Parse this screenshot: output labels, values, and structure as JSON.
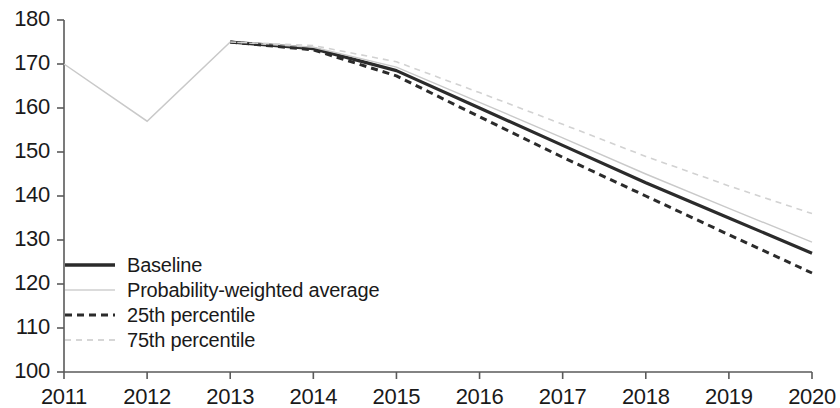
{
  "chart_data": {
    "type": "line",
    "title": "",
    "xlabel": "",
    "ylabel": "",
    "x": [
      2011,
      2012,
      2013,
      2014,
      2015,
      2016,
      2017,
      2018,
      2019,
      2020
    ],
    "categories": [
      "2011",
      "2012",
      "2013",
      "2014",
      "2015",
      "2016",
      "2017",
      "2018",
      "2019",
      "2020"
    ],
    "xlim": [
      2011,
      2020
    ],
    "ylim": [
      100,
      180
    ],
    "y_ticks": [
      100,
      110,
      120,
      130,
      140,
      150,
      160,
      170,
      180
    ],
    "x_ticks": [
      "2011",
      "2012",
      "2013",
      "2014",
      "2015",
      "2016",
      "2017",
      "2018",
      "2019",
      "2020"
    ],
    "grid": false,
    "legend_position": "inside-lower-left",
    "series": [
      {
        "name": "Baseline",
        "style": "solid",
        "color": "#2b2b2b",
        "width": 3.2,
        "values": [
          170.0,
          157.0,
          175.0,
          173.5,
          168.5,
          160.0,
          151.5,
          143.0,
          135.0,
          127.0
        ]
      },
      {
        "name": "Probability-weighted average",
        "style": "solid",
        "color": "#c9c9c9",
        "width": 1.4,
        "values": [
          170.0,
          157.0,
          175.0,
          173.8,
          169.3,
          161.3,
          153.2,
          145.0,
          137.2,
          129.5
        ]
      },
      {
        "name": "25th percentile",
        "style": "dashed",
        "color": "#2b2b2b",
        "width": 3.0,
        "values": [
          170.0,
          157.0,
          175.0,
          173.2,
          167.3,
          158.0,
          148.8,
          140.0,
          131.2,
          122.5
        ]
      },
      {
        "name": "75th percentile",
        "style": "dashed",
        "color": "#d2d2d2",
        "width": 1.6,
        "values": [
          170.0,
          157.0,
          175.0,
          174.2,
          170.5,
          163.5,
          156.3,
          149.0,
          142.3,
          136.0
        ]
      }
    ],
    "historical_segment": {
      "note": "2011-2013 is a single shared thin historical line",
      "x": [
        2011,
        2012,
        2013
      ],
      "values": [
        170.0,
        157.0,
        175.0
      ],
      "color": "#c9c9c9"
    }
  },
  "axes": {
    "y_labels": [
      "180",
      "170",
      "160",
      "150",
      "140",
      "130",
      "120",
      "110",
      "100"
    ],
    "x_labels": [
      "2011",
      "2012",
      "2013",
      "2014",
      "2015",
      "2016",
      "2017",
      "2018",
      "2019",
      "2020"
    ]
  },
  "legend": {
    "items": [
      {
        "label": "Baseline",
        "swatch": "solid-dark-line-icon"
      },
      {
        "label": "Probability-weighted average",
        "swatch": "solid-light-line-icon"
      },
      {
        "label": "25th percentile",
        "swatch": "dashed-dark-line-icon"
      },
      {
        "label": "75th percentile",
        "swatch": "dashed-light-line-icon"
      }
    ]
  },
  "colors": {
    "baseline": "#2b2b2b",
    "probability_weighted": "#c9c9c9",
    "p25": "#2b2b2b",
    "p75": "#d2d2d2",
    "axis": "#5a5a5a",
    "text": "#1a1a1a"
  }
}
